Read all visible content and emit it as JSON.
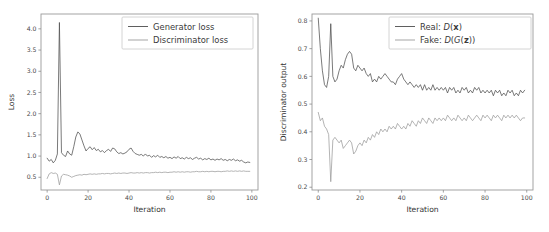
{
  "figure": {
    "background": "#ffffff",
    "panel_count": 2
  },
  "chart_data": [
    {
      "id": "loss-chart",
      "type": "line",
      "title": "",
      "xlabel": "Iteration",
      "ylabel": "Loss",
      "xlim": [
        -3,
        103
      ],
      "ylim": [
        0.2,
        4.35
      ],
      "xticks": [
        0,
        20,
        40,
        60,
        80,
        100
      ],
      "xticklabels": [
        "0",
        "20",
        "40",
        "60",
        "80",
        "100"
      ],
      "yticks": [
        0.5,
        1.0,
        1.5,
        2.0,
        2.5,
        3.0,
        3.5,
        4.0
      ],
      "yticklabels": [
        "0.5",
        "1.0",
        "1.5",
        "2.0",
        "2.5",
        "3.0",
        "3.5",
        "4.0"
      ],
      "grid": false,
      "legend_position": "upper right",
      "series": [
        {
          "name": "Generator loss",
          "color": "#4d4d4d",
          "x": [
            0,
            1,
            2,
            3,
            4,
            5,
            6,
            7,
            8,
            9,
            10,
            11,
            12,
            13,
            14,
            15,
            16,
            17,
            18,
            19,
            20,
            21,
            22,
            23,
            24,
            25,
            26,
            27,
            28,
            29,
            30,
            31,
            32,
            33,
            34,
            35,
            36,
            37,
            38,
            39,
            40,
            41,
            42,
            43,
            44,
            45,
            46,
            47,
            48,
            49,
            50,
            51,
            52,
            53,
            54,
            55,
            56,
            57,
            58,
            59,
            60,
            61,
            62,
            63,
            64,
            65,
            66,
            67,
            68,
            69,
            70,
            71,
            72,
            73,
            74,
            75,
            76,
            77,
            78,
            79,
            80,
            81,
            82,
            83,
            84,
            85,
            86,
            87,
            88,
            89,
            90,
            91,
            92,
            93,
            94,
            95,
            96,
            97,
            98,
            99
          ],
          "values": [
            0.95,
            0.88,
            0.92,
            0.84,
            0.9,
            1.05,
            4.15,
            1.08,
            1.02,
            0.99,
            1.12,
            1.05,
            1.02,
            1.22,
            1.45,
            1.57,
            1.52,
            1.38,
            1.24,
            1.12,
            1.18,
            1.22,
            1.15,
            1.2,
            1.13,
            1.16,
            1.1,
            1.13,
            1.08,
            1.13,
            1.16,
            1.11,
            1.19,
            1.17,
            1.1,
            1.06,
            1.08,
            1.05,
            1.07,
            1.1,
            1.16,
            1.19,
            1.11,
            1.06,
            1.04,
            1.02,
            1.04,
            1.0,
            1.05,
            1.0,
            1.02,
            0.97,
            1.01,
            0.98,
            1.02,
            0.97,
            0.99,
            0.96,
            0.99,
            0.95,
            0.97,
            0.94,
            0.98,
            0.95,
            0.99,
            0.94,
            0.96,
            0.93,
            0.97,
            0.94,
            0.96,
            0.92,
            0.95,
            0.97,
            0.93,
            0.95,
            0.91,
            0.94,
            0.92,
            0.95,
            0.91,
            0.93,
            0.9,
            0.93,
            0.91,
            0.94,
            0.9,
            0.92,
            0.89,
            0.92,
            0.9,
            0.93,
            0.89,
            0.91,
            0.88,
            0.9,
            0.86,
            0.84,
            0.86,
            0.85
          ]
        },
        {
          "name": "Discriminator loss",
          "color": "#9b9b9b",
          "x": [
            0,
            1,
            2,
            3,
            4,
            5,
            6,
            7,
            8,
            9,
            10,
            11,
            12,
            13,
            14,
            15,
            16,
            17,
            18,
            19,
            20,
            21,
            22,
            23,
            24,
            25,
            26,
            27,
            28,
            29,
            30,
            31,
            32,
            33,
            34,
            35,
            36,
            37,
            38,
            39,
            40,
            41,
            42,
            43,
            44,
            45,
            46,
            47,
            48,
            49,
            50,
            51,
            52,
            53,
            54,
            55,
            56,
            57,
            58,
            59,
            60,
            61,
            62,
            63,
            64,
            65,
            66,
            67,
            68,
            69,
            70,
            71,
            72,
            73,
            74,
            75,
            76,
            77,
            78,
            79,
            80,
            81,
            82,
            83,
            84,
            85,
            86,
            87,
            88,
            89,
            90,
            91,
            92,
            93,
            94,
            95,
            96,
            97,
            98,
            99
          ],
          "values": [
            0.47,
            0.58,
            0.61,
            0.59,
            0.6,
            0.57,
            0.32,
            0.53,
            0.57,
            0.56,
            0.55,
            0.53,
            0.5,
            0.52,
            0.54,
            0.55,
            0.56,
            0.55,
            0.57,
            0.56,
            0.57,
            0.58,
            0.57,
            0.58,
            0.57,
            0.58,
            0.58,
            0.59,
            0.58,
            0.59,
            0.59,
            0.58,
            0.59,
            0.6,
            0.59,
            0.6,
            0.59,
            0.6,
            0.6,
            0.59,
            0.6,
            0.61,
            0.6,
            0.6,
            0.61,
            0.6,
            0.61,
            0.6,
            0.61,
            0.61,
            0.6,
            0.61,
            0.61,
            0.62,
            0.61,
            0.62,
            0.61,
            0.62,
            0.62,
            0.61,
            0.62,
            0.62,
            0.63,
            0.62,
            0.63,
            0.62,
            0.63,
            0.62,
            0.63,
            0.63,
            0.62,
            0.63,
            0.63,
            0.64,
            0.63,
            0.63,
            0.64,
            0.63,
            0.64,
            0.63,
            0.64,
            0.64,
            0.63,
            0.64,
            0.64,
            0.63,
            0.64,
            0.64,
            0.65,
            0.64,
            0.65,
            0.64,
            0.65,
            0.64,
            0.65,
            0.64,
            0.65,
            0.64,
            0.64,
            0.64
          ]
        }
      ]
    },
    {
      "id": "discriminator-output-chart",
      "type": "line",
      "title": "",
      "xlabel": "Iteration",
      "ylabel": "Discriminator output",
      "xlim": [
        -3,
        103
      ],
      "ylim": [
        0.19,
        0.825
      ],
      "xticks": [
        0,
        20,
        40,
        60,
        80,
        100
      ],
      "xticklabels": [
        "0",
        "20",
        "40",
        "60",
        "80",
        "100"
      ],
      "yticks": [
        0.2,
        0.3,
        0.4,
        0.5,
        0.6,
        0.7,
        0.8
      ],
      "yticklabels": [
        "0.2",
        "0.3",
        "0.4",
        "0.5",
        "0.6",
        "0.7",
        "0.8"
      ],
      "grid": false,
      "legend_position": "upper right",
      "series": [
        {
          "name": "Real: D(x)",
          "name_parts": [
            {
              "text": "Real: ",
              "style": "normal"
            },
            {
              "text": "D",
              "style": "italic"
            },
            {
              "text": "(",
              "style": "normal"
            },
            {
              "text": "x",
              "style": "bold"
            },
            {
              "text": ")",
              "style": "normal"
            }
          ],
          "color": "#4d4d4d",
          "x": [
            0,
            1,
            2,
            3,
            4,
            5,
            6,
            7,
            8,
            9,
            10,
            11,
            12,
            13,
            14,
            15,
            16,
            17,
            18,
            19,
            20,
            21,
            22,
            23,
            24,
            25,
            26,
            27,
            28,
            29,
            30,
            31,
            32,
            33,
            34,
            35,
            36,
            37,
            38,
            39,
            40,
            41,
            42,
            43,
            44,
            45,
            46,
            47,
            48,
            49,
            50,
            51,
            52,
            53,
            54,
            55,
            56,
            57,
            58,
            59,
            60,
            61,
            62,
            63,
            64,
            65,
            66,
            67,
            68,
            69,
            70,
            71,
            72,
            73,
            74,
            75,
            76,
            77,
            78,
            79,
            80,
            81,
            82,
            83,
            84,
            85,
            86,
            87,
            88,
            89,
            90,
            91,
            92,
            93,
            94,
            95,
            96,
            97,
            98,
            99
          ],
          "values": [
            0.81,
            0.7,
            0.62,
            0.57,
            0.56,
            0.6,
            0.79,
            0.6,
            0.58,
            0.59,
            0.62,
            0.64,
            0.63,
            0.66,
            0.68,
            0.69,
            0.68,
            0.63,
            0.62,
            0.64,
            0.63,
            0.62,
            0.63,
            0.61,
            0.6,
            0.61,
            0.58,
            0.59,
            0.58,
            0.6,
            0.59,
            0.6,
            0.61,
            0.6,
            0.59,
            0.58,
            0.58,
            0.57,
            0.59,
            0.6,
            0.61,
            0.59,
            0.58,
            0.57,
            0.58,
            0.57,
            0.56,
            0.57,
            0.56,
            0.57,
            0.55,
            0.57,
            0.55,
            0.56,
            0.55,
            0.57,
            0.55,
            0.56,
            0.55,
            0.56,
            0.55,
            0.56,
            0.54,
            0.56,
            0.55,
            0.56,
            0.54,
            0.55,
            0.54,
            0.56,
            0.55,
            0.56,
            0.54,
            0.55,
            0.54,
            0.56,
            0.55,
            0.56,
            0.54,
            0.55,
            0.54,
            0.55,
            0.54,
            0.55,
            0.53,
            0.55,
            0.54,
            0.55,
            0.53,
            0.54,
            0.53,
            0.55,
            0.54,
            0.55,
            0.53,
            0.54,
            0.53,
            0.55,
            0.54,
            0.55
          ]
        },
        {
          "name": "Fake: D(G(z))",
          "name_parts": [
            {
              "text": "Fake: ",
              "style": "normal"
            },
            {
              "text": "D",
              "style": "italic"
            },
            {
              "text": "(",
              "style": "normal"
            },
            {
              "text": "G",
              "style": "italic"
            },
            {
              "text": "(",
              "style": "normal"
            },
            {
              "text": "z",
              "style": "bold"
            },
            {
              "text": "))",
              "style": "normal"
            }
          ],
          "color": "#9b9b9b",
          "x": [
            0,
            1,
            2,
            3,
            4,
            5,
            6,
            7,
            8,
            9,
            10,
            11,
            12,
            13,
            14,
            15,
            16,
            17,
            18,
            19,
            20,
            21,
            22,
            23,
            24,
            25,
            26,
            27,
            28,
            29,
            30,
            31,
            32,
            33,
            34,
            35,
            36,
            37,
            38,
            39,
            40,
            41,
            42,
            43,
            44,
            45,
            46,
            47,
            48,
            49,
            50,
            51,
            52,
            53,
            54,
            55,
            56,
            57,
            58,
            59,
            60,
            61,
            62,
            63,
            64,
            65,
            66,
            67,
            68,
            69,
            70,
            71,
            72,
            73,
            74,
            75,
            76,
            77,
            78,
            79,
            80,
            81,
            82,
            83,
            84,
            85,
            86,
            87,
            88,
            89,
            90,
            91,
            92,
            93,
            94,
            95,
            96,
            97,
            98,
            99
          ],
          "values": [
            0.47,
            0.44,
            0.45,
            0.42,
            0.41,
            0.39,
            0.22,
            0.37,
            0.38,
            0.37,
            0.36,
            0.37,
            0.34,
            0.35,
            0.36,
            0.37,
            0.36,
            0.32,
            0.33,
            0.35,
            0.36,
            0.35,
            0.37,
            0.36,
            0.38,
            0.37,
            0.39,
            0.38,
            0.4,
            0.39,
            0.41,
            0.4,
            0.41,
            0.4,
            0.42,
            0.41,
            0.42,
            0.41,
            0.43,
            0.42,
            0.41,
            0.42,
            0.41,
            0.43,
            0.42,
            0.44,
            0.43,
            0.42,
            0.44,
            0.43,
            0.45,
            0.44,
            0.43,
            0.45,
            0.44,
            0.43,
            0.45,
            0.44,
            0.45,
            0.44,
            0.45,
            0.44,
            0.46,
            0.45,
            0.44,
            0.45,
            0.44,
            0.46,
            0.45,
            0.44,
            0.45,
            0.44,
            0.46,
            0.45,
            0.44,
            0.45,
            0.46,
            0.45,
            0.44,
            0.46,
            0.45,
            0.46,
            0.45,
            0.44,
            0.46,
            0.45,
            0.46,
            0.45,
            0.44,
            0.46,
            0.45,
            0.46,
            0.45,
            0.46,
            0.45,
            0.46,
            0.45,
            0.44,
            0.45,
            0.45
          ]
        }
      ]
    }
  ]
}
